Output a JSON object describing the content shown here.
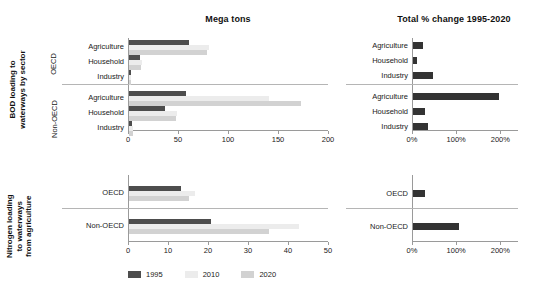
{
  "titles": {
    "mega_tons": "Mega tons",
    "pct_change": "Total % change 1995-2020"
  },
  "row_groups": [
    {
      "label": "BOD loading to\nwaterways by sector",
      "subgroups": [
        "OECD",
        "Non-OECD"
      ],
      "categories": [
        "Agriculture",
        "Household",
        "Industry"
      ]
    },
    {
      "label": "Nitrogen loading\nto waterways\nfrom agriculture",
      "subgroups": [
        "OECD",
        "Non-OECD"
      ],
      "categories": [
        "OECD",
        "Non-OECD"
      ]
    }
  ],
  "legend": {
    "items": [
      {
        "label": "1995",
        "color": "#4d4d4d"
      },
      {
        "label": "2010",
        "color": "#ececec"
      },
      {
        "label": "2020",
        "color": "#d2d2d2"
      }
    ]
  },
  "colors": {
    "series_1995": "#4d4d4d",
    "series_2010": "#ececec",
    "series_2020": "#d2d2d2",
    "pct_bar": "#333333",
    "axis": "#9a9a9a",
    "separator": "#b5b5b5",
    "text": "#1a1a1a"
  },
  "axes": {
    "bod_mega": {
      "min": 0,
      "max": 200,
      "ticks": [
        0,
        50,
        100,
        150,
        200
      ],
      "ticklabels": [
        "0",
        "50",
        "100",
        "150",
        "200"
      ]
    },
    "bod_pct": {
      "min": 0,
      "max": 240,
      "ticks": [
        0,
        100,
        200
      ],
      "ticklabels": [
        "0%",
        "100%",
        "200%"
      ]
    },
    "nit_mega": {
      "min": 0,
      "max": 50,
      "ticks": [
        0,
        10,
        20,
        30,
        40,
        50
      ],
      "ticklabels": [
        "0",
        "10",
        "20",
        "30",
        "40",
        "50"
      ]
    },
    "nit_pct": {
      "min": 0,
      "max": 240,
      "ticks": [
        0,
        100,
        200
      ],
      "ticklabels": [
        "0%",
        "100%",
        "200%"
      ]
    }
  },
  "chart_data": [
    {
      "type": "bar",
      "id": "bod-mega-tons",
      "title": "Mega tons",
      "subtitle": "BOD loading to waterways by sector",
      "orientation": "horizontal",
      "xlabel": "Mega tons",
      "ylabel": "",
      "xlim": [
        0,
        200
      ],
      "grid": false,
      "legend": "bottom",
      "groups": [
        "OECD",
        "Non-OECD"
      ],
      "categories": [
        "Agriculture",
        "Household",
        "Industry"
      ],
      "series": [
        {
          "name": "1995",
          "color": "#4d4d4d",
          "values": {
            "OECD": [
              60,
              11,
              1.5
            ],
            "Non-OECD": [
              57,
              36,
              3
            ]
          }
        },
        {
          "name": "2010",
          "color": "#ececec",
          "values": {
            "OECD": [
              80,
              13,
              2
            ],
            "Non-OECD": [
              140,
              48,
              3.5
            ]
          }
        },
        {
          "name": "2020",
          "color": "#d2d2d2",
          "values": {
            "OECD": [
              78,
              12,
              2
            ],
            "Non-OECD": [
              172,
              47,
              3.5
            ]
          }
        }
      ]
    },
    {
      "type": "bar",
      "id": "bod-pct-change",
      "title": "Total % change 1995-2020",
      "subtitle": "BOD loading to waterways by sector",
      "orientation": "horizontal",
      "xlabel": "Total % change 1995-2020",
      "ylabel": "",
      "xlim": [
        0,
        240
      ],
      "grid": false,
      "groups": [
        "OECD",
        "Non-OECD"
      ],
      "categories": [
        "Agriculture",
        "Household",
        "Industry"
      ],
      "series": [
        {
          "name": "Total % change 1995-2020",
          "color": "#333333",
          "values": {
            "OECD": [
              22,
              10,
              45
            ],
            "Non-OECD": [
              195,
              28,
              33
            ]
          }
        }
      ]
    },
    {
      "type": "bar",
      "id": "nitrogen-mega-tons",
      "title": "Mega tons",
      "subtitle": "Nitrogen loading to waterways from agriculture",
      "orientation": "horizontal",
      "xlabel": "Mega tons",
      "ylabel": "",
      "xlim": [
        0,
        50
      ],
      "grid": false,
      "groups": [
        "OECD",
        "Non-OECD"
      ],
      "categories": [
        "OECD",
        "Non-OECD"
      ],
      "series": [
        {
          "name": "1995",
          "color": "#4d4d4d",
          "values": {
            "OECD": [
              13
            ],
            "Non-OECD": [
              20.5
            ]
          }
        },
        {
          "name": "2010",
          "color": "#ececec",
          "values": {
            "OECD": [
              16.5
            ],
            "Non-OECD": [
              42.5
            ]
          }
        },
        {
          "name": "2020",
          "color": "#d2d2d2",
          "values": {
            "OECD": [
              15
            ],
            "Non-OECD": [
              35
            ]
          }
        }
      ]
    },
    {
      "type": "bar",
      "id": "nitrogen-pct-change",
      "title": "Total % change 1995-2020",
      "subtitle": "Nitrogen loading to waterways from agriculture",
      "orientation": "horizontal",
      "xlabel": "Total % change 1995-2020",
      "ylabel": "",
      "xlim": [
        0,
        240
      ],
      "grid": false,
      "groups": [
        "OECD",
        "Non-OECD"
      ],
      "categories": [
        "OECD",
        "Non-OECD"
      ],
      "series": [
        {
          "name": "Total % change 1995-2020",
          "color": "#333333",
          "values": {
            "OECD": [
              27
            ],
            "Non-OECD": [
              105
            ]
          }
        }
      ]
    }
  ]
}
